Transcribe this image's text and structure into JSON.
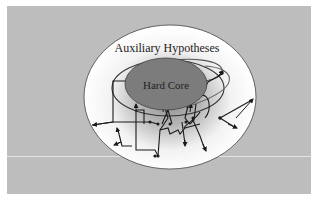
{
  "diagram": {
    "outer_label": "Auxiliary Hypotheses",
    "core_label": "Hard Core",
    "colors": {
      "background_panel": "#bdbdbd",
      "frame": "#ffffff",
      "outer_ellipse_center": "#9a9a9a",
      "outer_ellipse_edge": "#ffffff",
      "hard_core_fill": "#7a7a7a",
      "lines": "#1a1a1a"
    }
  }
}
